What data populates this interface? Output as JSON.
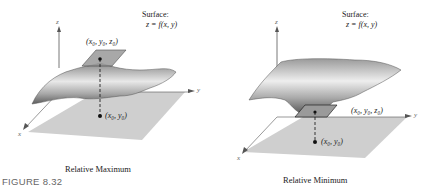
{
  "figure_label": "FIGURE 8.32",
  "left": {
    "surface_label": "Surface:",
    "surface_eq": "z = f(x, y)",
    "point_3d": "(x₀, y₀, z₀)",
    "point_2d": "(x₀, y₀)",
    "axis_x": "x",
    "axis_y": "y",
    "axis_z": "z",
    "caption": "Relative Maximum"
  },
  "right": {
    "surface_label": "Surface:",
    "surface_eq": "z = f(x, y)",
    "point_3d": "(x₀, y₀, z₀)",
    "point_2d": "(x₀, y₀)",
    "axis_x": "x",
    "axis_y": "y",
    "axis_z": "z",
    "caption": "Relative Minimum"
  },
  "colors": {
    "plane": "#cfcfcf",
    "surface_dark": "#6e6e6e",
    "surface_light": "#e6e6e6",
    "tangent_plane": "#9a9a9a"
  }
}
